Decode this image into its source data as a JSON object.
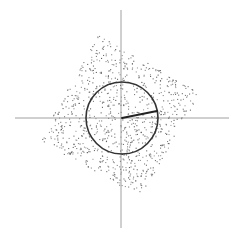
{
  "diagram": {
    "type": "scatter-with-circle",
    "axes": {
      "color": "#888888",
      "horizontal": {
        "x1": 15,
        "x2": 229,
        "y": 118
      },
      "vertical": {
        "x": 121,
        "y1": 10,
        "y2": 228
      }
    },
    "circle": {
      "cx": 122,
      "cy": 118,
      "r": 36,
      "stroke": "#333333",
      "stroke_width": 1.6
    },
    "radius_line": {
      "x1": 122,
      "y1": 118,
      "x2": 157,
      "y2": 111,
      "stroke": "#222222",
      "stroke_width": 1.8
    },
    "point_cloud": {
      "shape": "rotated-square",
      "corners": [
        [
          98,
          35
        ],
        [
          200,
          92
        ],
        [
          143,
          203
        ],
        [
          38,
          140
        ]
      ],
      "count": 900,
      "point_color": "#555555",
      "point_size": 1.1
    }
  }
}
